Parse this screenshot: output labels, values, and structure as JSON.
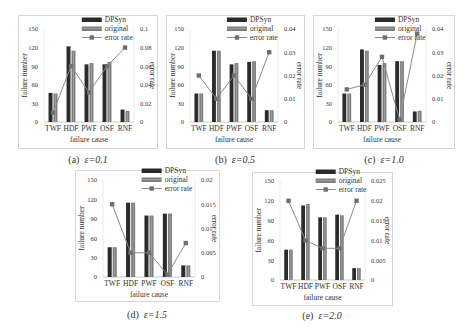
{
  "figure": {
    "colors": {
      "dpsyn": "#2b2b2b",
      "original": "#7d7d7d",
      "original_stripe": "#a8a8a8",
      "error_line": "#8a8a8a",
      "error_marker": "#6e6e6e",
      "frame": "#d6d6d6"
    },
    "legend": [
      "DPSyn",
      "original",
      "error rate"
    ]
  },
  "chart_data": [
    {
      "id": "a",
      "type": "bar",
      "caption_prefix": "(a)",
      "caption_eps": "ε=0.1",
      "categories": [
        "TWF",
        "HDF",
        "PWF",
        "OSF",
        "RNF"
      ],
      "series": [
        {
          "name": "DPSyn",
          "type": "bar",
          "axis": "left",
          "values": [
            47,
            122,
            93,
            93,
            20
          ]
        },
        {
          "name": "original",
          "type": "bar",
          "axis": "left",
          "values": [
            46,
            115,
            95,
            97,
            18
          ]
        },
        {
          "name": "error rate",
          "type": "line",
          "axis": "right",
          "values": [
            0.01,
            0.06,
            0.032,
            0.06,
            0.08
          ]
        }
      ],
      "xlabel": "failure cause",
      "ylabel": "failure number",
      "y2label": "error rate",
      "ylim": [
        0,
        150
      ],
      "yticks": [
        0,
        30,
        60,
        90,
        120,
        150
      ],
      "y2lim": [
        0,
        0.1
      ],
      "y2ticks": [
        0,
        0.02,
        0.04,
        0.06,
        0.08,
        0.1
      ],
      "y2ticklabels": [
        "0",
        "0.02",
        "0.04",
        "0.06",
        "0.08",
        "0.1"
      ],
      "legend_position": "top-right",
      "grid": false
    },
    {
      "id": "b",
      "type": "bar",
      "caption_prefix": "(b)",
      "caption_eps": "ε=0.5",
      "categories": [
        "TWF",
        "HDF",
        "PWF",
        "OSF",
        "RNF"
      ],
      "series": [
        {
          "name": "DPSyn",
          "type": "bar",
          "axis": "left",
          "values": [
            46,
            115,
            93,
            97,
            19
          ]
        },
        {
          "name": "original",
          "type": "bar",
          "axis": "left",
          "values": [
            46,
            115,
            95,
            98,
            19
          ]
        },
        {
          "name": "error rate",
          "type": "line",
          "axis": "right",
          "values": [
            0.02,
            0.01,
            0.02,
            0.01,
            0.03
          ]
        }
      ],
      "xlabel": "failure cause",
      "ylabel": "failure number",
      "y2label": "error rate",
      "ylim": [
        0,
        150
      ],
      "yticks": [
        0,
        30,
        60,
        90,
        120,
        150
      ],
      "y2lim": [
        0,
        0.04
      ],
      "y2ticks": [
        0,
        0.01,
        0.02,
        0.03,
        0.04
      ],
      "y2ticklabels": [
        "0",
        "0.01",
        "0.02",
        "0.03",
        "0.04"
      ],
      "legend_position": "top-right",
      "grid": false
    },
    {
      "id": "c",
      "type": "bar",
      "caption_prefix": "(c)",
      "caption_eps": "ε=1.0",
      "categories": [
        "TWF",
        "HDF",
        "PWF",
        "OSF",
        "RNF"
      ],
      "series": [
        {
          "name": "DPSyn",
          "type": "bar",
          "axis": "left",
          "values": [
            46,
            117,
            92,
            98,
            17
          ]
        },
        {
          "name": "original",
          "type": "bar",
          "axis": "left",
          "values": [
            46,
            115,
            95,
            98,
            18
          ]
        },
        {
          "name": "error rate",
          "type": "line",
          "axis": "right",
          "values": [
            0.014,
            0.016,
            0.028,
            0.001,
            0.038
          ]
        }
      ],
      "xlabel": "failure cause",
      "ylabel": "failure number",
      "y2label": "error rate",
      "ylim": [
        0,
        150
      ],
      "yticks": [
        0,
        30,
        60,
        90,
        120,
        150
      ],
      "y2lim": [
        0,
        0.04
      ],
      "y2ticks": [
        0,
        0.01,
        0.02,
        0.03,
        0.04
      ],
      "y2ticklabels": [
        "0",
        "0.01",
        "0.02",
        "0.03",
        "0.04"
      ],
      "legend_position": "top-right",
      "grid": false
    },
    {
      "id": "d",
      "type": "bar",
      "caption_prefix": "(d)",
      "caption_eps": "ε=1.5",
      "categories": [
        "TWF",
        "HDF",
        "PWF",
        "OSF",
        "RNF"
      ],
      "series": [
        {
          "name": "DPSyn",
          "type": "bar",
          "axis": "left",
          "values": [
            46,
            115,
            95,
            98,
            18
          ]
        },
        {
          "name": "original",
          "type": "bar",
          "axis": "left",
          "values": [
            46,
            115,
            95,
            98,
            18
          ]
        },
        {
          "name": "error rate",
          "type": "line",
          "axis": "right",
          "values": [
            0.015,
            0.005,
            0.005,
            0.0005,
            0.007
          ]
        }
      ],
      "xlabel": "failure cause",
      "ylabel": "failure number",
      "y2label": "error rate",
      "ylim": [
        0,
        150
      ],
      "yticks": [
        0,
        30,
        60,
        90,
        120,
        150
      ],
      "y2lim": [
        0,
        0.02
      ],
      "y2ticks": [
        0,
        0.005,
        0.01,
        0.015,
        0.02
      ],
      "y2ticklabels": [
        "0",
        "0.005",
        "0.01",
        "0.015",
        "0.02"
      ],
      "legend_position": "top-right",
      "grid": false
    },
    {
      "id": "e",
      "type": "bar",
      "caption_prefix": "(e)",
      "caption_eps": "ε=2.0",
      "categories": [
        "TWF",
        "HDF",
        "PWF",
        "OSF",
        "RNF"
      ],
      "series": [
        {
          "name": "DPSyn",
          "type": "bar",
          "axis": "left",
          "values": [
            46,
            113,
            95,
            99,
            18
          ]
        },
        {
          "name": "original",
          "type": "bar",
          "axis": "left",
          "values": [
            46,
            115,
            95,
            98,
            18
          ]
        },
        {
          "name": "error rate",
          "type": "line",
          "axis": "right",
          "values": [
            0.02,
            0.01,
            0.008,
            0.008,
            0.02
          ]
        }
      ],
      "xlabel": "failure cause",
      "ylabel": "failure number",
      "y2label": "error rate",
      "ylim": [
        0,
        150
      ],
      "yticks": [
        0,
        30,
        60,
        90,
        120,
        150
      ],
      "y2lim": [
        0,
        0.025
      ],
      "y2ticks": [
        0,
        0.005,
        0.01,
        0.015,
        0.02,
        0.025
      ],
      "y2ticklabels": [
        "0",
        "0.005",
        "0.01",
        "0.015",
        "0.02",
        "0.025"
      ],
      "legend_position": "top-right",
      "grid": false
    }
  ]
}
